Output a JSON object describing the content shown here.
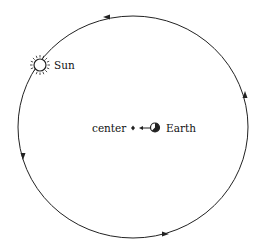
{
  "diagram": {
    "labels": {
      "sun": "Sun",
      "center": "center",
      "earth": "Earth"
    },
    "orbit": {
      "direction": "counterclockwise",
      "arrow_count": 4
    },
    "icons": [
      "sun-icon",
      "earth-icon",
      "center-point-icon",
      "direction-arrow-icon"
    ],
    "colors": {
      "line": "#222222",
      "background": "#ffffff"
    }
  }
}
